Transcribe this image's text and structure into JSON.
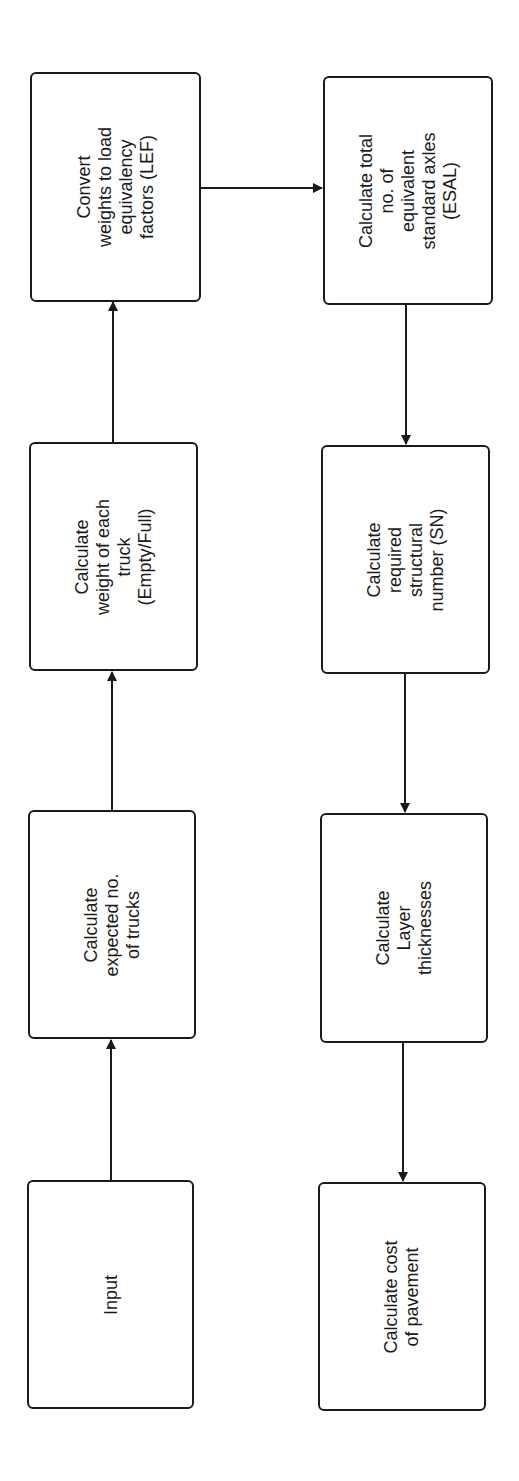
{
  "diagram": {
    "type": "flowchart",
    "orientation": "rotated-90",
    "colors": {
      "stroke": "#1a1a1a",
      "fill": "#ffffff",
      "background": "#ffffff"
    },
    "nodes": [
      {
        "id": "input",
        "label": "Input"
      },
      {
        "id": "trucks",
        "label": "Calculate\nexpected no.\nof trucks"
      },
      {
        "id": "weight",
        "label": "Calculate\nweight of each\ntruck\n(Empty/Full)"
      },
      {
        "id": "lef",
        "label": "Convert\nweights to load\nequivalency\nfactors (LEF)"
      },
      {
        "id": "esal",
        "label": "Calculate total\nno. of\nequivalent\nstandard axles\n(ESAL)"
      },
      {
        "id": "sn",
        "label": "Calculate\nrequired\nstructural\nnumber (SN)"
      },
      {
        "id": "layers",
        "label": "Calculate\nLayer\nthicknesses"
      },
      {
        "id": "cost",
        "label": "Calculate cost\nof pavement"
      }
    ],
    "edges": [
      {
        "from": "input",
        "to": "trucks"
      },
      {
        "from": "trucks",
        "to": "weight"
      },
      {
        "from": "weight",
        "to": "lef"
      },
      {
        "from": "lef",
        "to": "esal"
      },
      {
        "from": "esal",
        "to": "sn"
      },
      {
        "from": "sn",
        "to": "layers"
      },
      {
        "from": "layers",
        "to": "cost"
      }
    ]
  }
}
